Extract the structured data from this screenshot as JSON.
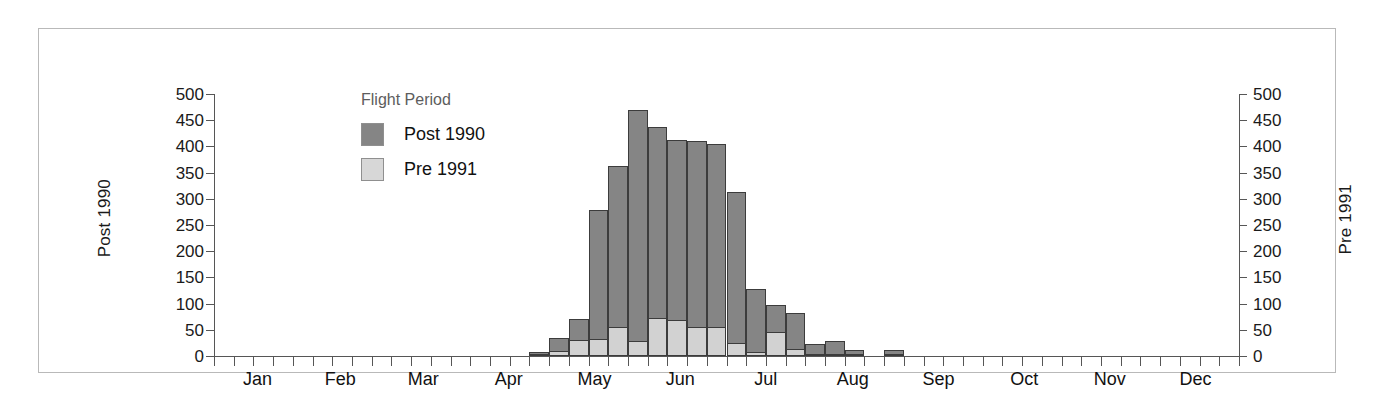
{
  "chart_data": {
    "type": "bar",
    "title": "",
    "subtitle": "",
    "xlabel": "",
    "ylabel": "Post 1990",
    "y2label": "Pre 1991",
    "ylim": [
      0,
      500
    ],
    "y2lim": [
      0,
      500
    ],
    "grid": false,
    "legend": {
      "title": "Flight Period",
      "position": "inside-top-left",
      "entries": [
        {
          "name": "Post 1990",
          "color": "#858585"
        },
        {
          "name": "Pre 1991",
          "color": "#d2d2d2"
        }
      ]
    },
    "y_ticks": [
      0,
      50,
      100,
      150,
      200,
      250,
      300,
      350,
      400,
      450,
      500
    ],
    "y2_ticks": [
      0,
      50,
      100,
      150,
      200,
      250,
      300,
      350,
      400,
      450,
      500
    ],
    "month_labels": [
      "Jan",
      "Feb",
      "Mar",
      "Apr",
      "May",
      "Jun",
      "Jul",
      "Aug",
      "Sep",
      "Oct",
      "Nov",
      "Dec"
    ],
    "x_description": "Weekly bins across the calendar year (52 intervals)",
    "series": [
      {
        "name": "Post 1990",
        "color": "#858585",
        "values": [
          0,
          0,
          0,
          0,
          0,
          0,
          0,
          0,
          0,
          0,
          0,
          0,
          0,
          0,
          0,
          0,
          8,
          35,
          70,
          278,
          362,
          470,
          437,
          412,
          410,
          405,
          313,
          128,
          98,
          83,
          22,
          28,
          12,
          0,
          12,
          0,
          0,
          0,
          0,
          0,
          0,
          0,
          0,
          0,
          0,
          0,
          0,
          0,
          0,
          0,
          0,
          0
        ]
      },
      {
        "name": "Pre 1991",
        "color": "#d2d2d2",
        "values": [
          0,
          0,
          0,
          0,
          0,
          0,
          0,
          0,
          0,
          0,
          0,
          0,
          0,
          0,
          0,
          0,
          4,
          10,
          30,
          32,
          55,
          28,
          72,
          68,
          56,
          56,
          24,
          8,
          45,
          14,
          4,
          4,
          2,
          0,
          2,
          0,
          0,
          0,
          0,
          0,
          0,
          0,
          0,
          0,
          0,
          0,
          0,
          0,
          0,
          0,
          0,
          0
        ]
      }
    ]
  },
  "colors": {
    "post_1990": "#858585",
    "pre_1991": "#d2d2d2",
    "axis": "#565656",
    "frame": "#b9b9b9",
    "text": "#1a1a1a",
    "legend_title": "#5d5d5d"
  }
}
